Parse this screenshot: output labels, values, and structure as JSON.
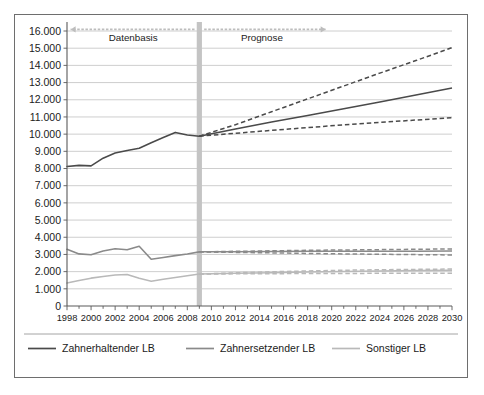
{
  "figure": {
    "frame_border_color": "#6e6e6e",
    "background": "#ffffff"
  },
  "chart_data": {
    "type": "line",
    "title": "",
    "subtitle": "",
    "xlabel": "",
    "ylabel": "",
    "xlim": [
      1998,
      2030
    ],
    "ylim": [
      0,
      16000
    ],
    "ytick_step": 1000,
    "xtick_step": 2,
    "grid": true,
    "legend_position": "bottom",
    "number_format": "de-DE (dot as thousands separator)",
    "x": [
      1998,
      1999,
      2000,
      2001,
      2002,
      2003,
      2004,
      2005,
      2006,
      2007,
      2008,
      2009,
      2010,
      2011,
      2012,
      2013,
      2014,
      2015,
      2016,
      2017,
      2018,
      2019,
      2020,
      2021,
      2022,
      2023,
      2024,
      2025,
      2026,
      2027,
      2028,
      2029,
      2030
    ],
    "ytick_labels": [
      "0",
      "1.000",
      "2.000",
      "3.000",
      "4.000",
      "5.000",
      "6.000",
      "7.000",
      "8.000",
      "9.000",
      "10.000",
      "11.000",
      "12.000",
      "13.000",
      "14.000",
      "15.000",
      "16.000"
    ],
    "xtick_labels": [
      "1998",
      "2000",
      "2002",
      "2004",
      "2006",
      "2008",
      "2010",
      "2012",
      "2014",
      "2016",
      "2018",
      "2020",
      "2022",
      "2024",
      "2026",
      "2028",
      "2030"
    ],
    "split_year": 2009,
    "annotations": [
      {
        "text": "Datenbasis",
        "at_x": 2003.5,
        "at_y": 15600,
        "arrow": "left",
        "arrow_from": 2008.6,
        "arrow_to": 1998.3
      },
      {
        "text": "Prognose",
        "at_x": 2014.2,
        "at_y": 15600,
        "arrow": "right",
        "arrow_from": 2009.4,
        "arrow_to": 2019.5
      }
    ],
    "series": [
      {
        "name": "Zahnerhaltender LB",
        "color": "#4a4a4a",
        "history_years": [
          1998,
          1999,
          2000,
          2001,
          2002,
          2003,
          2004,
          2005,
          2006,
          2007,
          2008,
          2009
        ],
        "history": [
          8120,
          8180,
          8150,
          8600,
          8900,
          9050,
          9180,
          9500,
          9800,
          10100,
          9950,
          9880
        ],
        "forecast_mid_years": [
          2009,
          2012,
          2015,
          2018,
          2021,
          2024,
          2027,
          2030
        ],
        "forecast_mid": [
          9880,
          10300,
          10700,
          11080,
          11480,
          11870,
          12280,
          12680
        ],
        "forecast_upper": [
          9880,
          10550,
          11300,
          12050,
          12800,
          13550,
          14280,
          15030
        ],
        "forecast_lower": [
          9880,
          10050,
          10220,
          10380,
          10540,
          10680,
          10820,
          10950
        ]
      },
      {
        "name": "Zahnersetzender LB",
        "color": "#8a8a8a",
        "history_years": [
          1998,
          1999,
          2000,
          2001,
          2002,
          2003,
          2004,
          2005,
          2006,
          2007,
          2008,
          2009
        ],
        "history": [
          3300,
          3030,
          2980,
          3200,
          3330,
          3270,
          3480,
          2720,
          2820,
          2930,
          3030,
          3150
        ],
        "forecast_mid_years": [
          2009,
          2012,
          2015,
          2018,
          2021,
          2024,
          2027,
          2030
        ],
        "forecast_mid": [
          3150,
          3160,
          3170,
          3180,
          3180,
          3190,
          3190,
          3200
        ],
        "forecast_upper": [
          3150,
          3180,
          3210,
          3240,
          3260,
          3280,
          3300,
          3320
        ],
        "forecast_lower": [
          3150,
          3120,
          3090,
          3060,
          3030,
          3010,
          2990,
          2970
        ]
      },
      {
        "name": "Sonstiger LB",
        "color": "#b9b9b9",
        "history_years": [
          1998,
          1999,
          2000,
          2001,
          2002,
          2003,
          2004,
          2005,
          2006,
          2007,
          2008,
          2009
        ],
        "history": [
          1340,
          1480,
          1620,
          1720,
          1800,
          1830,
          1610,
          1440,
          1560,
          1660,
          1760,
          1860
        ],
        "forecast_mid_years": [
          2009,
          2012,
          2015,
          2018,
          2021,
          2024,
          2027,
          2030
        ],
        "forecast_mid": [
          1860,
          1900,
          1940,
          1980,
          2010,
          2040,
          2060,
          2080
        ],
        "forecast_upper": [
          1860,
          1930,
          1990,
          2040,
          2080,
          2110,
          2130,
          2150
        ],
        "forecast_lower": [
          1860,
          1870,
          1880,
          1890,
          1895,
          1900,
          1900,
          1900
        ]
      }
    ]
  },
  "legend": {
    "items": [
      {
        "label": "Zahnerhaltender LB",
        "color": "#4a4a4a"
      },
      {
        "label": "Zahnersetzender LB",
        "color": "#8a8a8a"
      },
      {
        "label": "Sonstiger LB",
        "color": "#b9b9b9"
      }
    ]
  }
}
